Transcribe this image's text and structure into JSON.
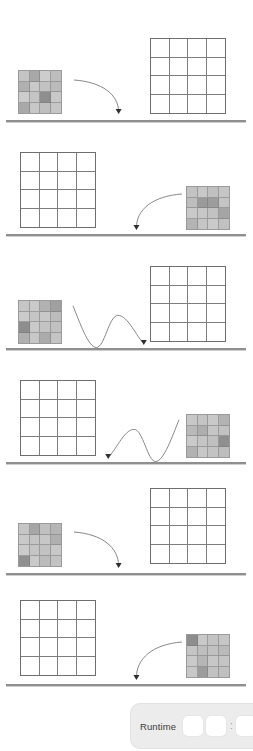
{
  "page": {
    "background_color": "#ffffff",
    "width": 253,
    "height": 751,
    "baseline_color": "#8f8f8f",
    "grid_line_color": "#7d7d7d",
    "grid_border_color": "#6e6e6e"
  },
  "legend": {
    "filled_grid_name": "pattern-grid",
    "empty_grid_name": "target-grid",
    "arrow_single_name": "curved-transfer-arrow",
    "arrow_double_name": "bouncing-transfer-arrow"
  },
  "rows": [
    {
      "index": 1,
      "baseline": {
        "top": 120,
        "left": 6,
        "width": 240
      },
      "source": {
        "position": "left",
        "x": 18,
        "y": 70,
        "size": 44,
        "state": "filled",
        "cells": [
          "#c4c4c4",
          "#a8a8a8",
          "#cdcdcd",
          "#bdbdbd",
          "#b0b0b0",
          "#c9c9c9",
          "#c2c2c2",
          "#bbbbbb",
          "#cccccc",
          "#c5c5c5",
          "#8e8e8e",
          "#c8c8c8",
          "#a9a9a9",
          "#c7c7c7",
          "#bfbfbf",
          "#c6c6c6"
        ]
      },
      "target": {
        "position": "right",
        "x": 150,
        "y": 38,
        "size": 76,
        "state": "empty",
        "cells": [
          "#ffffff",
          "#ffffff",
          "#ffffff",
          "#ffffff",
          "#ffffff",
          "#ffffff",
          "#ffffff",
          "#ffffff",
          "#ffffff",
          "#ffffff",
          "#ffffff",
          "#ffffff",
          "#ffffff",
          "#ffffff",
          "#ffffff",
          "#ffffff"
        ]
      },
      "arrow": {
        "type": "single-arc",
        "direction": "right",
        "x": 74,
        "y": 78,
        "width": 46,
        "height": 40
      }
    },
    {
      "index": 2,
      "baseline": {
        "top": 234,
        "left": 6,
        "width": 240
      },
      "source": {
        "position": "right",
        "x": 186,
        "y": 186,
        "size": 44,
        "state": "filled",
        "cells": [
          "#c3c3c3",
          "#c8c8c8",
          "#c0c0c0",
          "#c6c6c6",
          "#bdbdbd",
          "#9a9a9a",
          "#9d9d9d",
          "#c4c4c4",
          "#c9c9c9",
          "#c7c7c7",
          "#c2c2c2",
          "#a5a5a5",
          "#b4b4b4",
          "#c5c5c5",
          "#cacaca",
          "#c1c1c1"
        ]
      },
      "target": {
        "position": "left",
        "x": 20,
        "y": 152,
        "size": 76,
        "state": "empty",
        "cells": [
          "#ffffff",
          "#ffffff",
          "#ffffff",
          "#ffffff",
          "#ffffff",
          "#ffffff",
          "#ffffff",
          "#ffffff",
          "#ffffff",
          "#ffffff",
          "#ffffff",
          "#ffffff",
          "#ffffff",
          "#ffffff",
          "#ffffff",
          "#ffffff"
        ]
      },
      "arrow": {
        "type": "single-arc",
        "direction": "left",
        "x": 134,
        "y": 192,
        "width": 48,
        "height": 42
      }
    },
    {
      "index": 3,
      "baseline": {
        "top": 348,
        "left": 6,
        "width": 240
      },
      "source": {
        "position": "left",
        "x": 18,
        "y": 300,
        "size": 44,
        "state": "filled",
        "cells": [
          "#c6c6c6",
          "#cacaca",
          "#b2b2b2",
          "#a0a0a0",
          "#cbcbcb",
          "#c5c5c5",
          "#c8c8c8",
          "#bcbcbc",
          "#8d8d8d",
          "#c9c9c9",
          "#c3c3c3",
          "#c1c1c1",
          "#b0b0b0",
          "#c7c7c7",
          "#ababab",
          "#c4c4c4"
        ]
      },
      "target": {
        "position": "right",
        "x": 150,
        "y": 266,
        "size": 76,
        "state": "empty",
        "cells": [
          "#ffffff",
          "#ffffff",
          "#ffffff",
          "#ffffff",
          "#ffffff",
          "#ffffff",
          "#ffffff",
          "#ffffff",
          "#ffffff",
          "#ffffff",
          "#ffffff",
          "#ffffff",
          "#ffffff",
          "#ffffff",
          "#ffffff",
          "#ffffff"
        ]
      },
      "arrow": {
        "type": "double-arc",
        "direction": "right",
        "x": 72,
        "y": 300,
        "width": 74,
        "height": 48
      }
    },
    {
      "index": 4,
      "baseline": {
        "top": 462,
        "left": 6,
        "width": 240
      },
      "source": {
        "position": "right",
        "x": 186,
        "y": 414,
        "size": 44,
        "state": "filled",
        "cells": [
          "#c8c8c8",
          "#c4c4c4",
          "#c9c9c9",
          "#b3b3b3",
          "#b9b9b9",
          "#aeaeae",
          "#c6c6c6",
          "#c2c2c2",
          "#cacaca",
          "#c5c5c5",
          "#c0c0c0",
          "#8f8f8f",
          "#b1b1b1",
          "#c7c7c7",
          "#c3c3c3",
          "#bdbdbd"
        ]
      },
      "target": {
        "position": "left",
        "x": 20,
        "y": 380,
        "size": 76,
        "state": "empty",
        "cells": [
          "#ffffff",
          "#ffffff",
          "#ffffff",
          "#ffffff",
          "#ffffff",
          "#ffffff",
          "#ffffff",
          "#ffffff",
          "#ffffff",
          "#ffffff",
          "#ffffff",
          "#ffffff",
          "#ffffff",
          "#ffffff",
          "#ffffff",
          "#ffffff"
        ]
      },
      "arrow": {
        "type": "double-arc",
        "direction": "left",
        "x": 106,
        "y": 414,
        "width": 74,
        "height": 48
      }
    },
    {
      "index": 5,
      "baseline": {
        "top": 573,
        "left": 6,
        "width": 240
      },
      "source": {
        "position": "left",
        "x": 18,
        "y": 523,
        "size": 44,
        "state": "filled",
        "cells": [
          "#c6c6c6",
          "#a6a6a6",
          "#c0c0c0",
          "#b5b5b5",
          "#c9c9c9",
          "#c4c4c4",
          "#c7c7c7",
          "#afafaf",
          "#cbcbcb",
          "#c5c5c5",
          "#c2c2c2",
          "#c8c8c8",
          "#909090",
          "#cacaca",
          "#bbbbbb",
          "#c3c3c3"
        ]
      },
      "target": {
        "position": "right",
        "x": 150,
        "y": 488,
        "size": 76,
        "state": "empty",
        "cells": [
          "#ffffff",
          "#ffffff",
          "#ffffff",
          "#ffffff",
          "#ffffff",
          "#ffffff",
          "#ffffff",
          "#ffffff",
          "#ffffff",
          "#ffffff",
          "#ffffff",
          "#ffffff",
          "#ffffff",
          "#ffffff",
          "#ffffff",
          "#ffffff"
        ]
      },
      "arrow": {
        "type": "single-arc",
        "direction": "right",
        "x": 74,
        "y": 530,
        "width": 46,
        "height": 42
      }
    },
    {
      "index": 6,
      "baseline": {
        "top": 684,
        "left": 6,
        "width": 240
      },
      "source": {
        "position": "right",
        "x": 186,
        "y": 634,
        "size": 44,
        "state": "filled",
        "cells": [
          "#8e8e8e",
          "#c9c9c9",
          "#c3c3c3",
          "#c6c6c6",
          "#c5c5c5",
          "#bebebe",
          "#c1c1c1",
          "#bababa",
          "#cacaca",
          "#b6b6b6",
          "#c7c7c7",
          "#c4c4c4",
          "#c8c8c8",
          "#9c9c9c",
          "#c2c2c2",
          "#c0c0c0"
        ]
      },
      "target": {
        "position": "left",
        "x": 20,
        "y": 600,
        "size": 76,
        "state": "empty",
        "cells": [
          "#ffffff",
          "#ffffff",
          "#ffffff",
          "#ffffff",
          "#ffffff",
          "#ffffff",
          "#ffffff",
          "#ffffff",
          "#ffffff",
          "#ffffff",
          "#ffffff",
          "#ffffff",
          "#ffffff",
          "#ffffff",
          "#ffffff",
          "#ffffff"
        ]
      },
      "arrow": {
        "type": "single-arc",
        "direction": "left",
        "x": 134,
        "y": 640,
        "width": 48,
        "height": 44
      }
    }
  ],
  "runtime_bar": {
    "label": "Runtime",
    "separator": ":",
    "boxes": [
      "",
      "",
      "",
      ""
    ],
    "background_color": "#ececec",
    "box_color": "#ffffff"
  }
}
